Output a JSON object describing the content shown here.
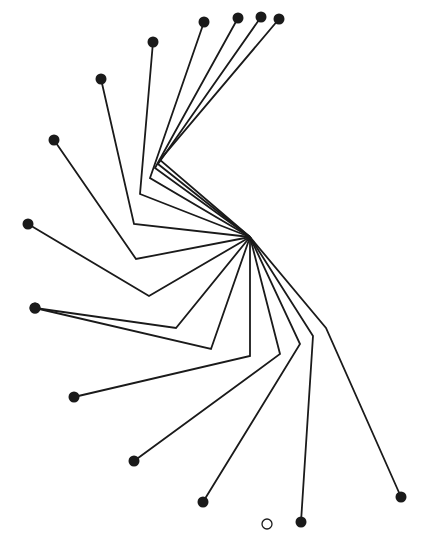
{
  "diagram": {
    "type": "radial-bent-link-tree",
    "width": 425,
    "height": 555,
    "hub": [
      250,
      237
    ],
    "line_color": "#1a1a1a",
    "dot_color": "#1a1a1a",
    "line_width": 1.8,
    "dot_radius": 5.5,
    "branches": [
      {
        "bend": [
          160,
          160
        ],
        "end": [
          279,
          19
        ]
      },
      {
        "bend": [
          158,
          164
        ],
        "end": [
          261,
          17
        ]
      },
      {
        "bend": [
          155,
          168
        ],
        "end": [
          238,
          18
        ]
      },
      {
        "bend": [
          150,
          178
        ],
        "end": [
          204,
          22
        ]
      },
      {
        "bend": [
          140,
          194
        ],
        "end": [
          153,
          42
        ]
      },
      {
        "bend": [
          134,
          224
        ],
        "end": [
          101,
          79
        ]
      },
      {
        "bend": [
          136,
          259
        ],
        "end": [
          54,
          140
        ]
      },
      {
        "bend": [
          149,
          296
        ],
        "end": [
          28,
          224
        ]
      },
      {
        "bend": [
          176,
          328
        ],
        "end": [
          35,
          308
        ]
      },
      {
        "bend": [
          211,
          349
        ],
        "end": [
          35,
          308
        ]
      },
      {
        "bend": [
          250,
          356
        ],
        "end": [
          74,
          397
        ]
      },
      {
        "bend": [
          280,
          354
        ],
        "end": [
          134,
          461
        ]
      },
      {
        "bend": [
          300,
          344
        ],
        "end": [
          203,
          502
        ]
      },
      {
        "bend": [
          313,
          336
        ],
        "end": [
          301,
          522
        ]
      },
      {
        "bend": [
          326,
          328
        ],
        "end": [
          401,
          497
        ]
      }
    ],
    "hollow_marker": {
      "center": [
        267,
        524
      ],
      "r": 5
    }
  }
}
